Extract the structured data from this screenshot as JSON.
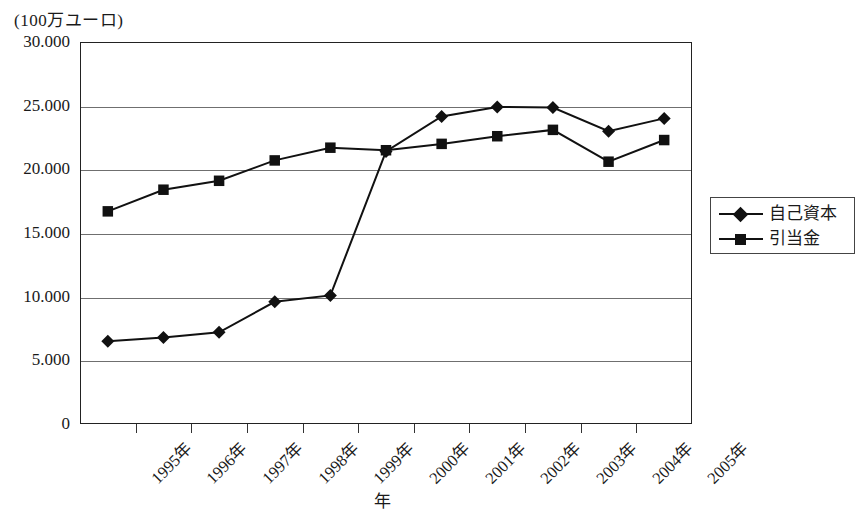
{
  "chart_data": {
    "type": "line",
    "title": "",
    "unit_label": "(100万ユーロ)",
    "xlabel": "年",
    "ylabel": "",
    "categories": [
      "1995年",
      "1996年",
      "1997年",
      "1998年",
      "1999年",
      "2000年",
      "2001年",
      "2002年",
      "2003年",
      "2004年",
      "2005年"
    ],
    "ylim": [
      0,
      30000
    ],
    "ytick_labels": [
      "30.000",
      "25.000",
      "20.000",
      "15.000",
      "10.000",
      "5.000",
      "0"
    ],
    "ytick_values": [
      30000,
      25000,
      20000,
      15000,
      10000,
      5000,
      0
    ],
    "grid": true,
    "legend_position": "right",
    "series": [
      {
        "name": "自己資本",
        "marker": "diamond",
        "color": "#111111",
        "values": [
          6500,
          6800,
          7200,
          9600,
          10100,
          21400,
          24150,
          24900,
          24850,
          23000,
          24000
        ]
      },
      {
        "name": "引当金",
        "marker": "square",
        "color": "#111111",
        "values": [
          16700,
          18400,
          19100,
          20700,
          21700,
          21500,
          22000,
          22600,
          23100,
          20600,
          22300
        ]
      }
    ]
  },
  "legend": {
    "items": [
      {
        "label": "自己資本",
        "marker": "diamond"
      },
      {
        "label": "引当金",
        "marker": "square"
      }
    ]
  }
}
